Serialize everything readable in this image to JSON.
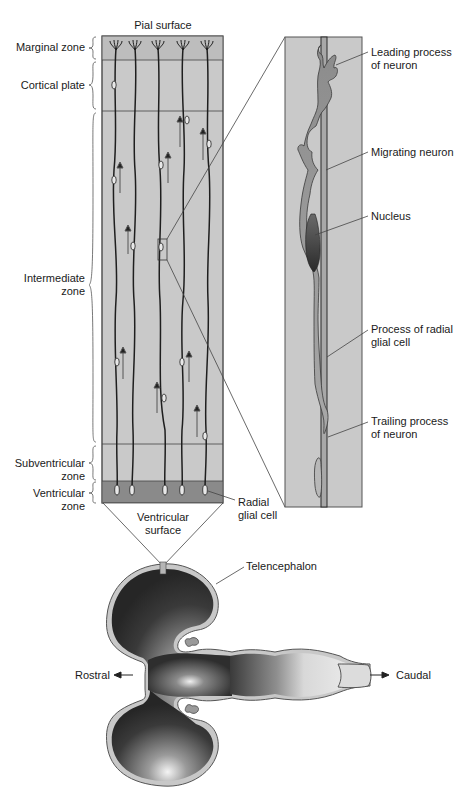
{
  "cortex_column": {
    "top_label": "Pial surface",
    "zones": [
      {
        "id": "marginal",
        "label_line1": "Marginal zone",
        "label_line2": ""
      },
      {
        "id": "cortical",
        "label_line1": "Cortical plate",
        "label_line2": ""
      },
      {
        "id": "intermediate",
        "label_line1": "Intermediate",
        "label_line2": "zone"
      },
      {
        "id": "subventricular",
        "label_line1": "Subventricular",
        "label_line2": "zone"
      },
      {
        "id": "ventricular",
        "label_line1": "Ventricular",
        "label_line2": "zone"
      }
    ],
    "radial_glial_label_line1": "Radial",
    "radial_glial_label_line2": "glial cell",
    "ventricular_surface_line1": "Ventricular",
    "ventricular_surface_line2": "surface"
  },
  "magnified_view": {
    "labels": [
      {
        "id": "leading-process",
        "line1": "Leading process",
        "line2": "of neuron"
      },
      {
        "id": "migrating-neuron",
        "line1": "Migrating neuron",
        "line2": ""
      },
      {
        "id": "nucleus",
        "line1": "Nucleus",
        "line2": ""
      },
      {
        "id": "radial-glial-process",
        "line1": "Process of radial",
        "line2": "glial cell"
      },
      {
        "id": "trailing-process",
        "line1": "Trailing process",
        "line2": "of neuron"
      }
    ]
  },
  "brain": {
    "telencephalon_label": "Telencephalon",
    "rostral_label": "Rostral",
    "caudal_label": "Caudal"
  },
  "colors": {
    "column_fill": "#c9c9c9",
    "marginal_fill": "#bdbdbd",
    "ventricular_fill": "#8a8a8a",
    "line": "#333333",
    "fiber": "#1e1e1e",
    "ventricle_dark": "#2b2b2b"
  }
}
